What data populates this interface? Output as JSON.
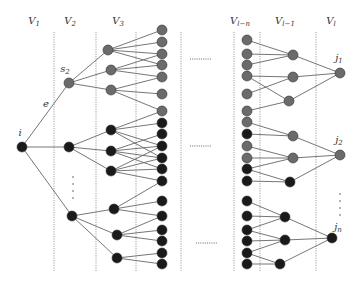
{
  "diagram": {
    "type": "layered-tree-graph",
    "colors": {
      "gray_node": "#6b6b6b",
      "black_node": "#1a1a1a",
      "edge": "#666666",
      "divider": "#888888"
    },
    "layer_labels": [
      {
        "id": "V1",
        "text": "V",
        "sub": "1",
        "x": 34
      },
      {
        "id": "V2",
        "text": "V",
        "sub": "2",
        "x": 70
      },
      {
        "id": "V3",
        "text": "V",
        "sub": "3",
        "x": 118
      },
      {
        "id": "Vl-n",
        "text": "V",
        "sub": "l−n",
        "x": 240
      },
      {
        "id": "Vl-1",
        "text": "V",
        "sub": "l−1",
        "x": 285
      },
      {
        "id": "Vl",
        "text": "V",
        "sub": "l",
        "x": 331
      }
    ],
    "dividers_x": [
      54,
      96,
      136,
      181,
      234,
      260,
      316
    ],
    "node_labels": [
      {
        "id": "i",
        "text": "i",
        "sub": "",
        "x": 20,
        "y": 136
      },
      {
        "id": "s2",
        "text": "s",
        "sub": "2",
        "x": 65,
        "y": 72
      },
      {
        "id": "e",
        "text": "e",
        "sub": "",
        "x": 46,
        "y": 107
      },
      {
        "id": "j1",
        "text": "j",
        "sub": "1",
        "x": 339,
        "y": 61
      },
      {
        "id": "j2",
        "text": "j",
        "sub": "2",
        "x": 339,
        "y": 143
      },
      {
        "id": "jn",
        "text": "j",
        "sub": "n",
        "x": 338,
        "y": 230
      }
    ],
    "ellipses_h": [
      {
        "x1": 190,
        "x2": 212,
        "y": 59
      },
      {
        "x1": 190,
        "x2": 212,
        "y": 146
      },
      {
        "x1": 196,
        "x2": 218,
        "y": 243
      }
    ],
    "ellipses_v": [
      {
        "x": 73,
        "y": [
          177,
          184,
          191,
          198
        ]
      },
      {
        "x": 340,
        "y": [
          194,
          201,
          208,
          215
        ]
      }
    ],
    "nodes": [
      {
        "id": "i",
        "x": 22,
        "y": 147,
        "c": "b"
      },
      {
        "id": "s2",
        "x": 69,
        "y": 83,
        "c": "g"
      },
      {
        "id": "a2",
        "x": 69,
        "y": 147,
        "c": "b"
      },
      {
        "id": "b2",
        "x": 72,
        "y": 216,
        "c": "b"
      },
      {
        "id": "m1",
        "x": 108,
        "y": 50,
        "c": "g"
      },
      {
        "id": "m2",
        "x": 111,
        "y": 70,
        "c": "g"
      },
      {
        "id": "m3",
        "x": 111,
        "y": 90,
        "c": "g"
      },
      {
        "id": "m4",
        "x": 111,
        "y": 130,
        "c": "b"
      },
      {
        "id": "m5",
        "x": 111,
        "y": 151,
        "c": "b"
      },
      {
        "id": "m6",
        "x": 111,
        "y": 171,
        "c": "b"
      },
      {
        "id": "m7",
        "x": 114,
        "y": 209,
        "c": "b"
      },
      {
        "id": "m8",
        "x": 117,
        "y": 235,
        "c": "b"
      },
      {
        "id": "m9",
        "x": 117,
        "y": 258,
        "c": "b"
      },
      {
        "id": "r1",
        "x": 162,
        "y": 30,
        "c": "g"
      },
      {
        "id": "r2",
        "x": 162,
        "y": 42,
        "c": "g"
      },
      {
        "id": "r3",
        "x": 162,
        "y": 54,
        "c": "g"
      },
      {
        "id": "r4",
        "x": 162,
        "y": 65,
        "c": "g"
      },
      {
        "id": "r5",
        "x": 162,
        "y": 77,
        "c": "g"
      },
      {
        "id": "r6",
        "x": 162,
        "y": 94,
        "c": "g"
      },
      {
        "id": "r7",
        "x": 162,
        "y": 111,
        "c": "g"
      },
      {
        "id": "r8",
        "x": 162,
        "y": 123,
        "c": "b"
      },
      {
        "id": "r9",
        "x": 162,
        "y": 134,
        "c": "b"
      },
      {
        "id": "r10",
        "x": 162,
        "y": 146,
        "c": "b"
      },
      {
        "id": "r11",
        "x": 162,
        "y": 158,
        "c": "b"
      },
      {
        "id": "r12",
        "x": 162,
        "y": 169,
        "c": "b"
      },
      {
        "id": "r13",
        "x": 162,
        "y": 181,
        "c": "b"
      },
      {
        "id": "r14",
        "x": 162,
        "y": 201,
        "c": "b"
      },
      {
        "id": "r15",
        "x": 162,
        "y": 216,
        "c": "b"
      },
      {
        "id": "r16",
        "x": 162,
        "y": 230,
        "c": "b"
      },
      {
        "id": "r17",
        "x": 162,
        "y": 241,
        "c": "b"
      },
      {
        "id": "r18",
        "x": 162,
        "y": 253,
        "c": "b"
      },
      {
        "id": "r19",
        "x": 162,
        "y": 264,
        "c": "b"
      },
      {
        "id": "L1",
        "x": 247,
        "y": 40,
        "c": "g"
      },
      {
        "id": "L2",
        "x": 247,
        "y": 54,
        "c": "g"
      },
      {
        "id": "L3",
        "x": 247,
        "y": 65,
        "c": "g"
      },
      {
        "id": "L4",
        "x": 247,
        "y": 76,
        "c": "g"
      },
      {
        "id": "L5",
        "x": 247,
        "y": 94,
        "c": "g"
      },
      {
        "id": "L6",
        "x": 247,
        "y": 111,
        "c": "g"
      },
      {
        "id": "L7",
        "x": 247,
        "y": 122,
        "c": "g"
      },
      {
        "id": "L8",
        "x": 247,
        "y": 134,
        "c": "b"
      },
      {
        "id": "L9",
        "x": 247,
        "y": 146,
        "c": "g"
      },
      {
        "id": "L10",
        "x": 247,
        "y": 158,
        "c": "g"
      },
      {
        "id": "L11",
        "x": 247,
        "y": 169,
        "c": "b"
      },
      {
        "id": "L12",
        "x": 247,
        "y": 181,
        "c": "b"
      },
      {
        "id": "L13",
        "x": 247,
        "y": 201,
        "c": "b"
      },
      {
        "id": "L14",
        "x": 247,
        "y": 216,
        "c": "b"
      },
      {
        "id": "L15",
        "x": 247,
        "y": 230,
        "c": "b"
      },
      {
        "id": "L16",
        "x": 247,
        "y": 241,
        "c": "b"
      },
      {
        "id": "L17",
        "x": 247,
        "y": 253,
        "c": "b"
      },
      {
        "id": "L18",
        "x": 247,
        "y": 264,
        "c": "b"
      },
      {
        "id": "P1",
        "x": 293,
        "y": 55,
        "c": "g"
      },
      {
        "id": "P2",
        "x": 293,
        "y": 77,
        "c": "g"
      },
      {
        "id": "P3",
        "x": 289,
        "y": 101,
        "c": "g"
      },
      {
        "id": "P4",
        "x": 293,
        "y": 136,
        "c": "g"
      },
      {
        "id": "P5",
        "x": 293,
        "y": 158,
        "c": "g"
      },
      {
        "id": "P6",
        "x": 290,
        "y": 182,
        "c": "b"
      },
      {
        "id": "P7",
        "x": 285,
        "y": 217,
        "c": "b"
      },
      {
        "id": "P8",
        "x": 285,
        "y": 240,
        "c": "b"
      },
      {
        "id": "P9",
        "x": 280,
        "y": 264,
        "c": "b"
      },
      {
        "id": "j1",
        "x": 340,
        "y": 73,
        "c": "g"
      },
      {
        "id": "j2",
        "x": 340,
        "y": 155,
        "c": "g"
      },
      {
        "id": "jn",
        "x": 332,
        "y": 238,
        "c": "b"
      }
    ],
    "edges": [
      [
        "i",
        "s2"
      ],
      [
        "i",
        "a2"
      ],
      [
        "i",
        "b2"
      ],
      [
        "s2",
        "m1"
      ],
      [
        "s2",
        "m2"
      ],
      [
        "s2",
        "m3"
      ],
      [
        "a2",
        "m4"
      ],
      [
        "a2",
        "m5"
      ],
      [
        "a2",
        "m6"
      ],
      [
        "b2",
        "m7"
      ],
      [
        "b2",
        "m8"
      ],
      [
        "b2",
        "m9"
      ],
      [
        "m1",
        "r1"
      ],
      [
        "m1",
        "r2"
      ],
      [
        "m1",
        "r3"
      ],
      [
        "m1",
        "r4"
      ],
      [
        "m2",
        "r3"
      ],
      [
        "m2",
        "r4"
      ],
      [
        "m2",
        "r5"
      ],
      [
        "m3",
        "r5"
      ],
      [
        "m3",
        "r6"
      ],
      [
        "m3",
        "r7"
      ],
      [
        "m4",
        "r7"
      ],
      [
        "m4",
        "r8"
      ],
      [
        "m4",
        "r10"
      ],
      [
        "m4",
        "r11"
      ],
      [
        "m5",
        "r9"
      ],
      [
        "m5",
        "r10"
      ],
      [
        "m5",
        "r11"
      ],
      [
        "m5",
        "r12"
      ],
      [
        "m6",
        "r10"
      ],
      [
        "m6",
        "r11"
      ],
      [
        "m6",
        "r12"
      ],
      [
        "m6",
        "r13"
      ],
      [
        "m7",
        "r13"
      ],
      [
        "m7",
        "r14"
      ],
      [
        "m7",
        "r15"
      ],
      [
        "m8",
        "r15"
      ],
      [
        "m8",
        "r16"
      ],
      [
        "m8",
        "r17"
      ],
      [
        "m9",
        "r18"
      ],
      [
        "m9",
        "r19"
      ],
      [
        "L1",
        "P1"
      ],
      [
        "L2",
        "P1"
      ],
      [
        "L3",
        "P1"
      ],
      [
        "L4",
        "P2"
      ],
      [
        "L4",
        "P3"
      ],
      [
        "L5",
        "P2"
      ],
      [
        "L6",
        "P3"
      ],
      [
        "L7",
        "P4"
      ],
      [
        "L8",
        "P4"
      ],
      [
        "L9",
        "P5"
      ],
      [
        "L10",
        "P5"
      ],
      [
        "L11",
        "P5"
      ],
      [
        "L11",
        "P6"
      ],
      [
        "L12",
        "P6"
      ],
      [
        "L13",
        "P7"
      ],
      [
        "L14",
        "P7"
      ],
      [
        "L15",
        "P7"
      ],
      [
        "L15",
        "P8"
      ],
      [
        "L16",
        "P8"
      ],
      [
        "L17",
        "P8"
      ],
      [
        "L17",
        "P9"
      ],
      [
        "L18",
        "P9"
      ],
      [
        "P1",
        "j1"
      ],
      [
        "P3",
        "j1"
      ],
      [
        "P2",
        "j1"
      ],
      [
        "P4",
        "j2"
      ],
      [
        "P5",
        "j2"
      ],
      [
        "P6",
        "j2"
      ],
      [
        "P7",
        "jn"
      ],
      [
        "P8",
        "jn"
      ],
      [
        "P9",
        "jn"
      ]
    ]
  }
}
